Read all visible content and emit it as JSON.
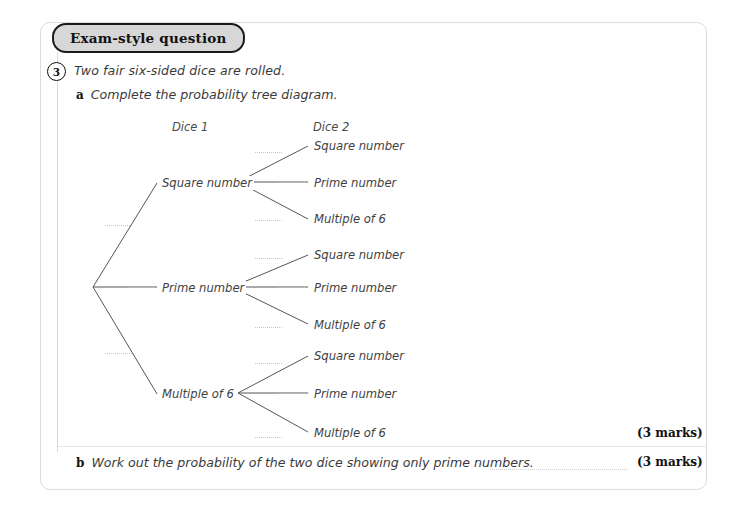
{
  "card": {
    "badge_label": "Exam-style question",
    "question_number": "3",
    "question_text": "Two fair six-sided dice are rolled.",
    "parts": [
      {
        "label": "a",
        "text": "Complete the probability tree diagram.",
        "marks": "(3 marks)"
      },
      {
        "label": "b",
        "text": "Work out the probability of the two dice showing only prime numbers.",
        "marks": "(3 marks)"
      }
    ]
  },
  "tree": {
    "column_headings": [
      "Dice 1",
      "Dice 2"
    ],
    "level1_nodes": [
      {
        "label": "Square number"
      },
      {
        "label": "Prime number"
      },
      {
        "label": "Multiple of 6"
      }
    ],
    "level2_nodes": [
      {
        "label": "Square number"
      },
      {
        "label": "Prime number"
      },
      {
        "label": "Multiple of 6"
      },
      {
        "label": "Square number"
      },
      {
        "label": "Prime number"
      },
      {
        "label": "Multiple of 6"
      },
      {
        "label": "Square number"
      },
      {
        "label": "Prime number"
      },
      {
        "label": "Multiple of 6"
      }
    ],
    "probability_blanks_level1": [
      "",
      "",
      ""
    ],
    "probability_blanks_level2": [
      "",
      "",
      "",
      "",
      "",
      "",
      "",
      "",
      ""
    ],
    "answer_blank": ""
  },
  "colors": {
    "badge_fill": "#d7d7d7",
    "badge_border": "#1a1a1a",
    "card_border": "#dcdcdc",
    "branch_line": "#555555",
    "dotted_line": "#c6c6c6",
    "body_text": "#3b3b3b"
  }
}
